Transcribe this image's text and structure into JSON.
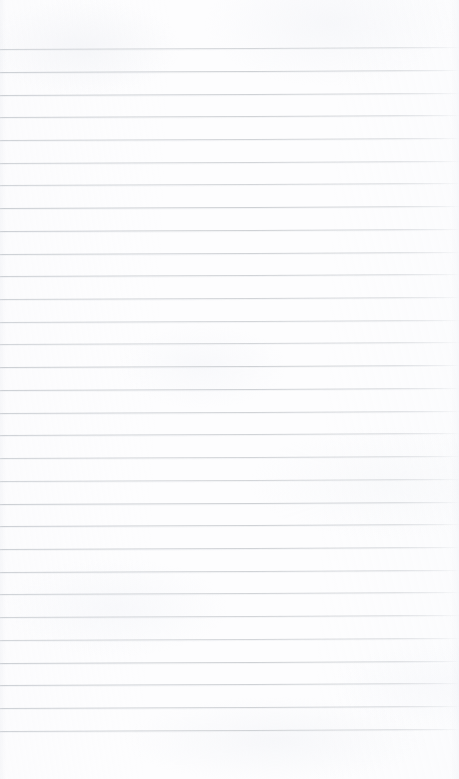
{
  "page": {
    "kind": "scanned-ruled-notebook-page",
    "width_px": 459,
    "height_px": 779,
    "background_color": "#fdfdfe",
    "paper_tone": "near-white",
    "text_content": "",
    "handwriting_present": "no",
    "printed_text_present": "no"
  },
  "ruling": {
    "line_color": "#c9ccd0",
    "line_color_left_end": "#b9bec4",
    "line_color_right_fade": "#dde0e4",
    "line_thickness_px": 1,
    "line_count": 31,
    "first_line_y_px": 49,
    "last_line_y_px": 731,
    "line_spacing_px": 22.73,
    "slant_degrees": -0.25,
    "slant_description": "lines rise very slightly toward the right edge",
    "left_inset_px": 0,
    "right_fade_start_px": 440,
    "vertical_margin_rule": "none",
    "line_y_positions": [
      49,
      71.7,
      94.5,
      117.2,
      139.9,
      162.6,
      185.4,
      208.1,
      230.8,
      253.5,
      276.3,
      299,
      321.7,
      344.4,
      367.2,
      389.9,
      412.6,
      435.3,
      458.1,
      480.8,
      503.5,
      526.2,
      549,
      571.7,
      594.4,
      617.1,
      639.9,
      662.6,
      685.3,
      708,
      730.8
    ]
  },
  "margins": {
    "top_blank_band_px": 49,
    "bottom_blank_band_px": 48,
    "top_blank_description": "blank header area above the first rule",
    "bottom_blank_description": "blank footer area below the last rule"
  },
  "artifacts": {
    "scan_mottling": "faint light-grey blotches across the sheet",
    "edge_shading": "slight grey shading at the left and right scan edges",
    "visible_labels": []
  }
}
